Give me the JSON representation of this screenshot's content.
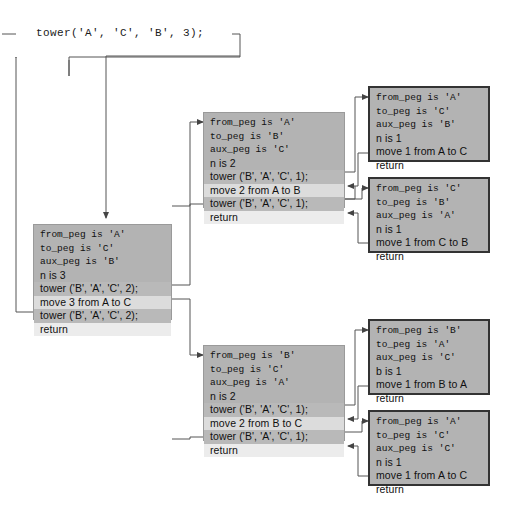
{
  "diagram": {
    "title_call": "tower('A', 'C', 'B', 3);",
    "type": "recursion-trace",
    "colors": {
      "frame_fill": "#b3b3b3",
      "frame_border_dark": "#333333",
      "frame_border_light": "#9a9a9a",
      "row_call_highlight": "#b9b9b9",
      "row_move_highlight": "#dcdcdc",
      "row_return_highlight": "#ececec",
      "wire": "#555555",
      "background": "#ffffff"
    }
  },
  "frames": [
    {
      "id": "frame-root",
      "name": "tower-A-C-B-3",
      "rows": [
        {
          "text": "from_peg is 'A'",
          "style": "mono"
        },
        {
          "text": "to_peg is 'C'",
          "style": "mono"
        },
        {
          "text": "aux_peg is 'B'",
          "style": "mono"
        },
        {
          "text": "n is 3",
          "style": "plain"
        },
        {
          "text": "tower ('B', 'A', 'C', 2);",
          "style": "call"
        },
        {
          "text": "move 3 from A to C",
          "style": "move"
        },
        {
          "text": "tower ('B', 'A', 'C', 2);",
          "style": "call"
        },
        {
          "text": "return",
          "style": "return"
        }
      ]
    },
    {
      "id": "frame-mid-top",
      "name": "tower-A-B-C-2",
      "rows": [
        {
          "text": "from_peg is 'A'",
          "style": "mono"
        },
        {
          "text": "to_peg is 'B'",
          "style": "mono"
        },
        {
          "text": "aux_peg is 'C'",
          "style": "mono"
        },
        {
          "text": "n is 2",
          "style": "plain"
        },
        {
          "text": "tower ('B', 'A', 'C', 1);",
          "style": "call"
        },
        {
          "text": "move 2 from A to B",
          "style": "move"
        },
        {
          "text": "tower ('B', 'A', 'C', 1);",
          "style": "call"
        },
        {
          "text": "return",
          "style": "return"
        }
      ]
    },
    {
      "id": "frame-mid-bottom",
      "name": "tower-B-C-A-2",
      "rows": [
        {
          "text": "from_peg is 'B'",
          "style": "mono"
        },
        {
          "text": "to_peg is 'C'",
          "style": "mono"
        },
        {
          "text": "aux_peg is 'A'",
          "style": "mono"
        },
        {
          "text": "n is 2",
          "style": "plain"
        },
        {
          "text": "tower ('B', 'A', 'C', 1);",
          "style": "call"
        },
        {
          "text": "move 2 from B to C",
          "style": "move"
        },
        {
          "text": "tower ('B', 'A', 'C', 1);",
          "style": "call"
        },
        {
          "text": "return",
          "style": "return"
        }
      ]
    },
    {
      "id": "frame-leaf-1",
      "name": "tower-A-C-B-1",
      "rows": [
        {
          "text": "from_peg is 'A'",
          "style": "mono"
        },
        {
          "text": "to_peg is 'C'",
          "style": "mono"
        },
        {
          "text": "aux_peg is 'B'",
          "style": "mono"
        },
        {
          "text": "n is 1",
          "style": "plain"
        },
        {
          "text": "move 1 from A to C",
          "style": "plain"
        },
        {
          "text": "return",
          "style": "plain"
        }
      ]
    },
    {
      "id": "frame-leaf-2",
      "name": "tower-C-B-A-1",
      "rows": [
        {
          "text": "from_peg is 'C'",
          "style": "mono"
        },
        {
          "text": "to_peg is 'B'",
          "style": "mono"
        },
        {
          "text": "aux_peg is 'A'",
          "style": "mono"
        },
        {
          "text": "n is 1",
          "style": "plain"
        },
        {
          "text": "move 1 from C to B",
          "style": "plain"
        },
        {
          "text": "return",
          "style": "plain"
        }
      ]
    },
    {
      "id": "frame-leaf-3",
      "name": "tower-B-A-C-1",
      "rows": [
        {
          "text": "from_peg is 'B'",
          "style": "mono"
        },
        {
          "text": "to_peg is 'A'",
          "style": "mono"
        },
        {
          "text": "aux_peg is 'C'",
          "style": "mono"
        },
        {
          "text": "b is 1",
          "style": "plain"
        },
        {
          "text": "move 1 from B to A",
          "style": "plain"
        },
        {
          "text": "return",
          "style": "plain"
        }
      ]
    },
    {
      "id": "frame-leaf-4",
      "name": "tower-A-C-C-1",
      "rows": [
        {
          "text": "from_peg is 'A'",
          "style": "mono"
        },
        {
          "text": "to_peg is 'C'",
          "style": "mono"
        },
        {
          "text": "aux_peg is 'C'",
          "style": "mono"
        },
        {
          "text": "n is 1",
          "style": "plain"
        },
        {
          "text": "move 1 from A to C",
          "style": "plain"
        },
        {
          "text": "return",
          "style": "plain"
        }
      ]
    }
  ]
}
